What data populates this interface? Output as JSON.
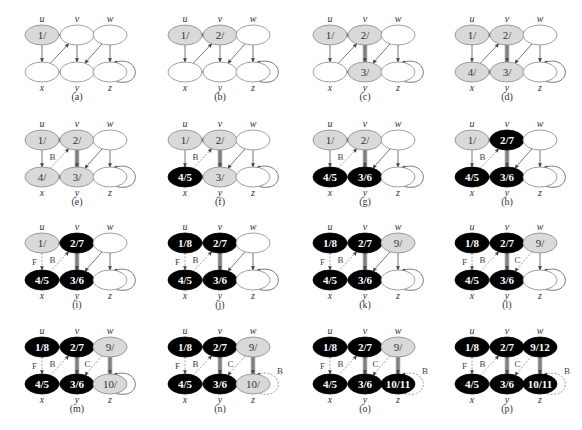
{
  "figure": {
    "colors": {
      "white_node_fill": "#ffffff",
      "gray_node_fill": "#d9d9d9",
      "black_node_fill": "#000000",
      "node_stroke": "#888888",
      "tree_edge": "#999999",
      "edge": "#555555",
      "nontree_edge": "#888888"
    },
    "vertices": [
      "u",
      "v",
      "w",
      "x",
      "y",
      "z"
    ],
    "edges": [
      {
        "from": "u",
        "to": "v"
      },
      {
        "from": "u",
        "to": "x"
      },
      {
        "from": "x",
        "to": "v"
      },
      {
        "from": "v",
        "to": "y"
      },
      {
        "from": "y",
        "to": "x"
      },
      {
        "from": "w",
        "to": "y"
      },
      {
        "from": "w",
        "to": "z"
      },
      {
        "from": "z",
        "to": "z"
      }
    ],
    "panels": [
      {
        "caption": "(a)",
        "nodes": {
          "u": {
            "label": "1/",
            "color": "gray"
          },
          "v": {
            "label": "",
            "color": "white"
          },
          "w": {
            "label": "",
            "color": "white"
          },
          "x": {
            "label": "",
            "color": "white"
          },
          "y": {
            "label": "",
            "color": "white"
          },
          "z": {
            "label": "",
            "color": "white"
          }
        },
        "edge_types": {}
      },
      {
        "caption": "(b)",
        "nodes": {
          "u": {
            "label": "1/",
            "color": "gray"
          },
          "v": {
            "label": "2/",
            "color": "gray"
          },
          "w": {
            "label": "",
            "color": "white"
          },
          "x": {
            "label": "",
            "color": "white"
          },
          "y": {
            "label": "",
            "color": "white"
          },
          "z": {
            "label": "",
            "color": "white"
          }
        },
        "edge_types": {
          "u-v": "T"
        }
      },
      {
        "caption": "(c)",
        "nodes": {
          "u": {
            "label": "1/",
            "color": "gray"
          },
          "v": {
            "label": "2/",
            "color": "gray"
          },
          "w": {
            "label": "",
            "color": "white"
          },
          "x": {
            "label": "",
            "color": "white"
          },
          "y": {
            "label": "3/",
            "color": "gray"
          },
          "z": {
            "label": "",
            "color": "white"
          }
        },
        "edge_types": {
          "u-v": "T",
          "v-y": "T"
        }
      },
      {
        "caption": "(d)",
        "nodes": {
          "u": {
            "label": "1/",
            "color": "gray"
          },
          "v": {
            "label": "2/",
            "color": "gray"
          },
          "w": {
            "label": "",
            "color": "white"
          },
          "x": {
            "label": "4/",
            "color": "gray"
          },
          "y": {
            "label": "3/",
            "color": "gray"
          },
          "z": {
            "label": "",
            "color": "white"
          }
        },
        "edge_types": {
          "u-v": "T",
          "v-y": "T",
          "y-x": "T"
        }
      },
      {
        "caption": "(e)",
        "nodes": {
          "u": {
            "label": "1/",
            "color": "gray"
          },
          "v": {
            "label": "2/",
            "color": "gray"
          },
          "w": {
            "label": "",
            "color": "white"
          },
          "x": {
            "label": "4/",
            "color": "gray"
          },
          "y": {
            "label": "3/",
            "color": "gray"
          },
          "z": {
            "label": "",
            "color": "white"
          }
        },
        "edge_types": {
          "u-v": "T",
          "v-y": "T",
          "y-x": "T",
          "x-v": "B"
        }
      },
      {
        "caption": "(f)",
        "nodes": {
          "u": {
            "label": "1/",
            "color": "gray"
          },
          "v": {
            "label": "2/",
            "color": "gray"
          },
          "w": {
            "label": "",
            "color": "white"
          },
          "x": {
            "label": "4/5",
            "color": "black"
          },
          "y": {
            "label": "3/",
            "color": "gray"
          },
          "z": {
            "label": "",
            "color": "white"
          }
        },
        "edge_types": {
          "u-v": "T",
          "v-y": "T",
          "y-x": "T",
          "x-v": "B"
        }
      },
      {
        "caption": "(g)",
        "nodes": {
          "u": {
            "label": "1/",
            "color": "gray"
          },
          "v": {
            "label": "2/",
            "color": "gray"
          },
          "w": {
            "label": "",
            "color": "white"
          },
          "x": {
            "label": "4/5",
            "color": "black"
          },
          "y": {
            "label": "3/6",
            "color": "black"
          },
          "z": {
            "label": "",
            "color": "white"
          }
        },
        "edge_types": {
          "u-v": "T",
          "v-y": "T",
          "y-x": "T",
          "x-v": "B"
        }
      },
      {
        "caption": "(h)",
        "nodes": {
          "u": {
            "label": "1/",
            "color": "gray"
          },
          "v": {
            "label": "2/7",
            "color": "black"
          },
          "w": {
            "label": "",
            "color": "white"
          },
          "x": {
            "label": "4/5",
            "color": "black"
          },
          "y": {
            "label": "3/6",
            "color": "black"
          },
          "z": {
            "label": "",
            "color": "white"
          }
        },
        "edge_types": {
          "u-v": "T",
          "v-y": "T",
          "y-x": "T",
          "x-v": "B"
        }
      },
      {
        "caption": "(i)",
        "nodes": {
          "u": {
            "label": "1/",
            "color": "gray"
          },
          "v": {
            "label": "2/7",
            "color": "black"
          },
          "w": {
            "label": "",
            "color": "white"
          },
          "x": {
            "label": "4/5",
            "color": "black"
          },
          "y": {
            "label": "3/6",
            "color": "black"
          },
          "z": {
            "label": "",
            "color": "white"
          }
        },
        "edge_types": {
          "u-v": "T",
          "v-y": "T",
          "y-x": "T",
          "x-v": "B",
          "u-x": "F"
        }
      },
      {
        "caption": "(j)",
        "nodes": {
          "u": {
            "label": "1/8",
            "color": "black"
          },
          "v": {
            "label": "2/7",
            "color": "black"
          },
          "w": {
            "label": "",
            "color": "white"
          },
          "x": {
            "label": "4/5",
            "color": "black"
          },
          "y": {
            "label": "3/6",
            "color": "black"
          },
          "z": {
            "label": "",
            "color": "white"
          }
        },
        "edge_types": {
          "u-v": "T",
          "v-y": "T",
          "y-x": "T",
          "x-v": "B",
          "u-x": "F"
        }
      },
      {
        "caption": "(k)",
        "nodes": {
          "u": {
            "label": "1/8",
            "color": "black"
          },
          "v": {
            "label": "2/7",
            "color": "black"
          },
          "w": {
            "label": "9/",
            "color": "gray"
          },
          "x": {
            "label": "4/5",
            "color": "black"
          },
          "y": {
            "label": "3/6",
            "color": "black"
          },
          "z": {
            "label": "",
            "color": "white"
          }
        },
        "edge_types": {
          "u-v": "T",
          "v-y": "T",
          "y-x": "T",
          "x-v": "B",
          "u-x": "F"
        }
      },
      {
        "caption": "(l)",
        "nodes": {
          "u": {
            "label": "1/8",
            "color": "black"
          },
          "v": {
            "label": "2/7",
            "color": "black"
          },
          "w": {
            "label": "9/",
            "color": "gray"
          },
          "x": {
            "label": "4/5",
            "color": "black"
          },
          "y": {
            "label": "3/6",
            "color": "black"
          },
          "z": {
            "label": "",
            "color": "white"
          }
        },
        "edge_types": {
          "u-v": "T",
          "v-y": "T",
          "y-x": "T",
          "x-v": "B",
          "u-x": "F",
          "w-y": "C"
        }
      },
      {
        "caption": "(m)",
        "nodes": {
          "u": {
            "label": "1/8",
            "color": "black"
          },
          "v": {
            "label": "2/7",
            "color": "black"
          },
          "w": {
            "label": "9/",
            "color": "gray"
          },
          "x": {
            "label": "4/5",
            "color": "black"
          },
          "y": {
            "label": "3/6",
            "color": "black"
          },
          "z": {
            "label": "10/",
            "color": "gray"
          }
        },
        "edge_types": {
          "u-v": "T",
          "v-y": "T",
          "y-x": "T",
          "x-v": "B",
          "u-x": "F",
          "w-y": "C",
          "w-z": "T"
        }
      },
      {
        "caption": "(n)",
        "nodes": {
          "u": {
            "label": "1/8",
            "color": "black"
          },
          "v": {
            "label": "2/7",
            "color": "black"
          },
          "w": {
            "label": "9/",
            "color": "gray"
          },
          "x": {
            "label": "4/5",
            "color": "black"
          },
          "y": {
            "label": "3/6",
            "color": "black"
          },
          "z": {
            "label": "10/",
            "color": "gray"
          }
        },
        "edge_types": {
          "u-v": "T",
          "v-y": "T",
          "y-x": "T",
          "x-v": "B",
          "u-x": "F",
          "w-y": "C",
          "w-z": "T",
          "z-z": "B"
        }
      },
      {
        "caption": "(o)",
        "nodes": {
          "u": {
            "label": "1/8",
            "color": "black"
          },
          "v": {
            "label": "2/7",
            "color": "black"
          },
          "w": {
            "label": "9/",
            "color": "gray"
          },
          "x": {
            "label": "4/5",
            "color": "black"
          },
          "y": {
            "label": "3/6",
            "color": "black"
          },
          "z": {
            "label": "10/11",
            "color": "black"
          }
        },
        "edge_types": {
          "u-v": "T",
          "v-y": "T",
          "y-x": "T",
          "x-v": "B",
          "u-x": "F",
          "w-y": "C",
          "w-z": "T",
          "z-z": "B"
        }
      },
      {
        "caption": "(p)",
        "nodes": {
          "u": {
            "label": "1/8",
            "color": "black"
          },
          "v": {
            "label": "2/7",
            "color": "black"
          },
          "w": {
            "label": "9/12",
            "color": "black"
          },
          "x": {
            "label": "4/5",
            "color": "black"
          },
          "y": {
            "label": "3/6",
            "color": "black"
          },
          "z": {
            "label": "10/11",
            "color": "black"
          }
        },
        "edge_types": {
          "u-v": "T",
          "v-y": "T",
          "y-x": "T",
          "x-v": "B",
          "u-x": "F",
          "w-y": "C",
          "w-z": "T",
          "z-z": "B"
        }
      }
    ]
  }
}
